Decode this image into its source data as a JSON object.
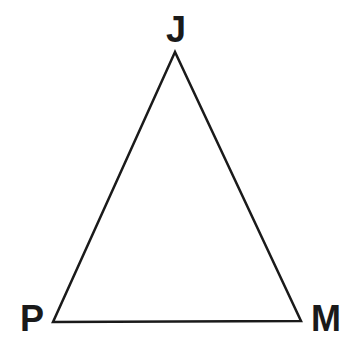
{
  "diagram": {
    "type": "triangle",
    "vertices": [
      {
        "label": "J",
        "x": 175,
        "y": 52
      },
      {
        "label": "P",
        "x": 53,
        "y": 322
      },
      {
        "label": "M",
        "x": 301,
        "y": 321
      }
    ],
    "stroke_color": "#1a1a1a",
    "background": "#ffffff"
  }
}
